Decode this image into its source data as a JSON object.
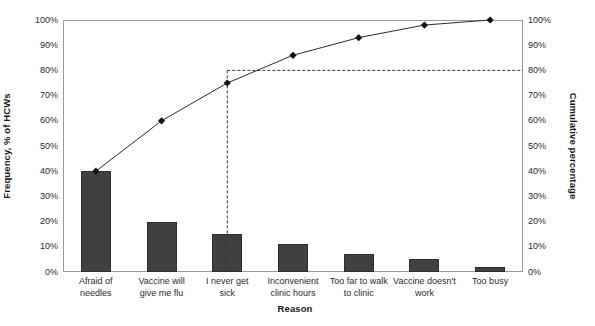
{
  "chart_data": {
    "type": "bar",
    "title": "",
    "subtitle": "",
    "xlabel": "Reason",
    "ylabel": "Frequency, % of HCWs",
    "y2label": "Cumulative percentage",
    "categories": [
      "Afraid of\nneedles",
      "Vaccine will\ngive me flu",
      "I never get\nsick",
      "Inconvenient\nclinic hours",
      "Too far to walk\nto clinic",
      "Vaccine doesn't\nwork",
      "Too busy"
    ],
    "series": [
      {
        "name": "Frequency, % of HCWs",
        "type": "bar",
        "values": [
          40,
          20,
          15,
          11,
          7,
          5,
          2
        ]
      },
      {
        "name": "Cumulative percentage",
        "type": "line",
        "values": [
          40,
          60,
          75,
          86,
          93,
          98,
          100
        ]
      }
    ],
    "ylim": [
      0,
      100
    ],
    "y2lim": [
      0,
      100
    ],
    "ytick_labels": [
      "0%",
      "10%",
      "20%",
      "30%",
      "40%",
      "50%",
      "60%",
      "70%",
      "80%",
      "90%",
      "100%"
    ],
    "ytick_values": [
      0,
      10,
      20,
      30,
      40,
      50,
      60,
      70,
      80,
      90,
      100
    ],
    "y2tick_labels": [
      "0%",
      "10%",
      "20%",
      "30%",
      "40%",
      "50%",
      "60%",
      "70%",
      "80%",
      "90%",
      "100%"
    ],
    "y2tick_values": [
      0,
      10,
      20,
      30,
      40,
      50,
      60,
      70,
      80,
      90,
      100
    ],
    "grid": false,
    "legend": "none",
    "annotations": [
      {
        "name": "eighty-percent-reference",
        "kind": "horizontal-dashed-line",
        "value": 80,
        "from_x_index": 2.5,
        "to_x_index": 7
      },
      {
        "name": "vital-few-divider",
        "kind": "vertical-dashed-line",
        "at_x_index": 2.5,
        "from_value": 0,
        "to_value": 80
      }
    ],
    "colors": {
      "bar_fill": "#404040",
      "bar_stroke": "#2e2e2e",
      "line": "#2b2b2b",
      "marker": "#111111",
      "dashed_reference": "#3a3a3a",
      "axis": "#9a9a9a",
      "text": "#2b2b2b",
      "background": "#ffffff"
    }
  }
}
